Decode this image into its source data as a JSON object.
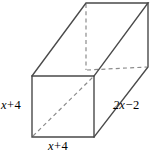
{
  "figure": {
    "name": "rectangular-prism",
    "background_color": "#ffffff",
    "solid_edge_color": "#4a4a4a",
    "hidden_edge_color": "#8c8c8c",
    "label_color": "#000000"
  },
  "labels": {
    "height": {
      "variable": "x",
      "operator": "+",
      "number": "4",
      "full": "x + 4"
    },
    "width": {
      "variable": "x",
      "operator": "+",
      "number": "4",
      "full": "x + 4"
    },
    "depth": {
      "variable": "2x",
      "operator": "−",
      "number": "2",
      "full": "2x − 2"
    }
  },
  "geometry": {
    "front_face": {
      "top_left": [
        32,
        76
      ],
      "top_right": [
        94,
        76
      ],
      "bottom_right": [
        94,
        137
      ],
      "bottom_left": [
        32,
        137
      ]
    },
    "back_face": {
      "top_left": [
        86,
        3
      ],
      "top_right": [
        148,
        3
      ],
      "bottom_right": [
        148,
        67
      ],
      "bottom_left": [
        86,
        70
      ]
    },
    "hidden_edges": [
      "back-left-vertical",
      "back-bottom-horizontal",
      "front-face-diagonal"
    ]
  }
}
